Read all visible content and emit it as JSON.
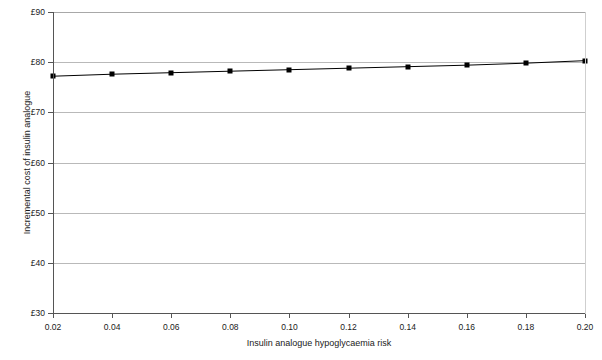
{
  "chart_data": {
    "type": "line",
    "title": "",
    "xlabel": "Insulin analogue hypoglycaemia risk",
    "ylabel": "Incremental cost of insulin analogue",
    "x": [
      0.02,
      0.04,
      0.06,
      0.08,
      0.1,
      0.12,
      0.14,
      0.16,
      0.18,
      0.2
    ],
    "values": [
      77.2,
      77.6,
      77.9,
      78.2,
      78.5,
      78.8,
      79.1,
      79.4,
      79.8,
      80.3
    ],
    "xlim": [
      0.02,
      0.2
    ],
    "ylim": [
      30,
      90
    ],
    "xticks": [
      0.02,
      0.04,
      0.06,
      0.08,
      0.1,
      0.12,
      0.14,
      0.16,
      0.18,
      0.2
    ],
    "xtick_labels": [
      "0.02",
      "0.04",
      "0.06",
      "0.08",
      "0.10",
      "0.12",
      "0.14",
      "0.16",
      "0.18",
      "0.20"
    ],
    "yticks": [
      30,
      40,
      50,
      60,
      70,
      80,
      90
    ],
    "ytick_labels": [
      "£30",
      "£40",
      "£50",
      "£60",
      "£70",
      "£80",
      "£90"
    ],
    "grid": "horizontal",
    "legend": "none",
    "series_color": "#000000",
    "gridline_color": "#b9b9b9",
    "marker": "square"
  }
}
